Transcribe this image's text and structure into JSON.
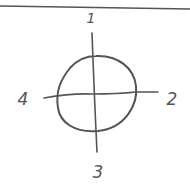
{
  "diagram": {
    "style": "hand-drawn sketch",
    "stroke_color": "#555555",
    "background": "#ffffff",
    "top_rule": {
      "x1": 0,
      "y1": 6,
      "x2": 190,
      "y2": 9
    },
    "circle": {
      "cx": 96,
      "cy": 94,
      "rx": 39,
      "ry": 38
    },
    "vertical_axis": {
      "x1": 92,
      "y1": 33,
      "x2": 97,
      "y2": 152
    },
    "horizontal_axis": {
      "x1": 44,
      "y1": 98,
      "x2": 158,
      "y2": 92
    },
    "labels": [
      {
        "id": "top",
        "text": "1",
        "x": 91,
        "y": 18
      },
      {
        "id": "right",
        "text": "2",
        "x": 172,
        "y": 98
      },
      {
        "id": "bottom",
        "text": "3",
        "x": 98,
        "y": 172
      },
      {
        "id": "left",
        "text": "4",
        "x": 23,
        "y": 98
      }
    ]
  }
}
